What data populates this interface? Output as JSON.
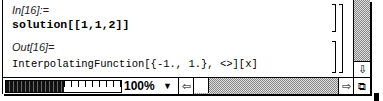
{
  "notebook": {
    "cells": [
      {
        "label": "In[16]:=",
        "code": "solution[[1,1,2]]"
      },
      {
        "label": "Out[16]=",
        "code": "InterpolatingFunction[{-1., 1.}, <>][x]"
      }
    ]
  },
  "statusbar": {
    "zoom_level": "100%",
    "zoom_arrow": "▼"
  },
  "icons": {
    "scroll_down": "⇩",
    "scroll_left": "⇦",
    "scroll_right": "⇨",
    "grow_box": "⧉"
  }
}
